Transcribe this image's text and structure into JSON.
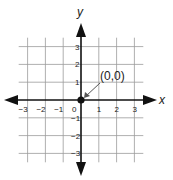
{
  "diagram": {
    "x_axis_label": "x",
    "y_axis_label": "y",
    "x_ticks": [
      -3,
      -2,
      -1,
      0,
      1,
      2,
      3
    ],
    "y_ticks": [
      -3,
      -2,
      -1,
      1,
      2,
      3
    ],
    "x_tick_labels": [
      "−3",
      "−2",
      "−1",
      "0",
      "1",
      "2",
      "3"
    ],
    "y_tick_labels": [
      "−3",
      "−2",
      "−1",
      "1",
      "2",
      "3"
    ],
    "grid_range": [
      -3.5,
      3.5
    ],
    "point": {
      "x": 0,
      "y": 0,
      "label": "(0,0)"
    },
    "colors": {
      "axis": "#111111",
      "grid": "#9a9a9a",
      "point": "#111111",
      "leader": "#555555"
    }
  }
}
